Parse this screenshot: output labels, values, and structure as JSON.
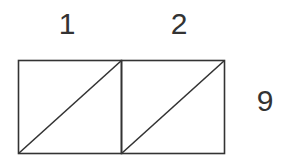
{
  "diagram": {
    "type": "rectangle-grid",
    "rows": 1,
    "columns": 2,
    "column_labels": [
      "1",
      "2"
    ],
    "row_label": "9",
    "cells": [
      {
        "index": 0,
        "diagonal": "bottom-left to top-right"
      },
      {
        "index": 1,
        "diagonal": "bottom-left to top-right"
      }
    ],
    "stroke_color": "#333333",
    "background_color": "#ffffff"
  }
}
